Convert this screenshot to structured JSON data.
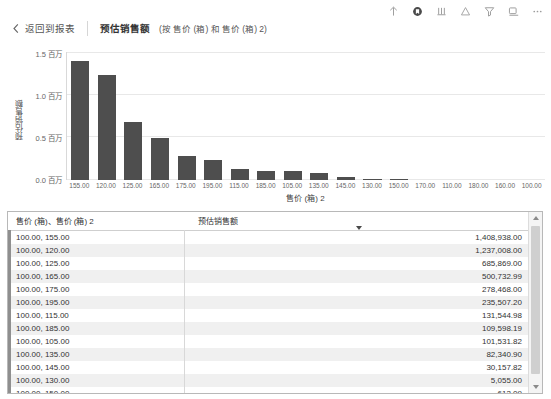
{
  "toolbar": {
    "icons": [
      {
        "name": "export-up-icon",
        "label": "导出"
      },
      {
        "name": "bookmark-icon",
        "label": "书签"
      },
      {
        "name": "sort-bars-icon",
        "label": "排序"
      },
      {
        "name": "alert-icon",
        "label": "警报"
      },
      {
        "name": "filter-icon",
        "label": "筛选器"
      },
      {
        "name": "focus-mode-icon",
        "label": "聚焦模式"
      },
      {
        "name": "more-options-icon",
        "label": "更多选项"
      }
    ]
  },
  "header": {
    "back_label": "返回到报表",
    "title": "预估销售额",
    "subtitle": "(按 售价 (箱) 和 售价 (箱) 2)"
  },
  "chart_data": {
    "type": "bar",
    "title": "预估销售额 (按 售价 (箱) 和 售价 (箱) 2)",
    "xlabel": "售价 (箱) 2",
    "ylabel": "预估销售额",
    "ylim": [
      0,
      1500000
    ],
    "ytick_labels": [
      "1.5 百万",
      "1.0 百万",
      "0.5 百万",
      "0.0 百万"
    ],
    "ytick_values": [
      1500000,
      1000000,
      500000,
      0
    ],
    "grid": true,
    "legend": "",
    "categories": [
      "155.00",
      "120.00",
      "125.00",
      "165.00",
      "175.00",
      "195.00",
      "115.00",
      "185.00",
      "105.00",
      "135.00",
      "145.00",
      "130.00",
      "150.00",
      "170.00",
      "110.00",
      "180.00",
      "160.00",
      "100.00"
    ],
    "values": [
      1408938.0,
      1237008.0,
      685869.0,
      500732.99,
      278468.0,
      235507.2,
      131544.98,
      109598.19,
      101531.82,
      82340.9,
      30157.82,
      5055.0,
      612.09,
      0,
      0,
      0,
      0,
      0
    ]
  },
  "table": {
    "columns": [
      "售价 (箱)、售价 (箱) 2",
      "预估销售额"
    ],
    "sort_column_index": 1,
    "sort_direction": "desc",
    "rows": [
      {
        "key": "100.00,  155.00",
        "value": "1,408,938.00"
      },
      {
        "key": "100.00,  120.00",
        "value": "1,237,008.00"
      },
      {
        "key": "100.00,  125.00",
        "value": "685,869.00"
      },
      {
        "key": "100.00,  165.00",
        "value": "500,732.99"
      },
      {
        "key": "100.00,  175.00",
        "value": "278,468.00"
      },
      {
        "key": "100.00,  195.00",
        "value": "235,507.20"
      },
      {
        "key": "100.00,  115.00",
        "value": "131,544.98"
      },
      {
        "key": "100.00,  185.00",
        "value": "109,598.19"
      },
      {
        "key": "100.00,  105.00",
        "value": "101,531.82"
      },
      {
        "key": "100.00,  135.00",
        "value": "82,340.90"
      },
      {
        "key": "100.00,  145.00",
        "value": "30,157.82"
      },
      {
        "key": "100.00,  130.00",
        "value": "5,055.00"
      },
      {
        "key": "100.00,  150.00",
        "value": "612.09"
      }
    ]
  },
  "colors": {
    "bar": "#4e4e4e",
    "grid": "#e8e8e8",
    "panel_border": "#b8b8b8",
    "row_alt": "#f0f0f0"
  }
}
